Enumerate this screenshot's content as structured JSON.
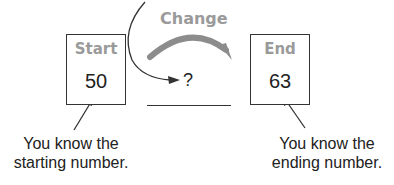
{
  "diagram": {
    "start_box": {
      "label": "Start",
      "value": "50"
    },
    "change": {
      "label": "Change",
      "unknown": "?"
    },
    "end_box": {
      "label": "End",
      "value": "63"
    },
    "captions": {
      "start": "You know the starting number.",
      "end": "You know the ending number."
    },
    "colors": {
      "label_gray": "#9a9a9a",
      "arrow_gray": "#8c8c8c",
      "ink": "#222222"
    }
  }
}
